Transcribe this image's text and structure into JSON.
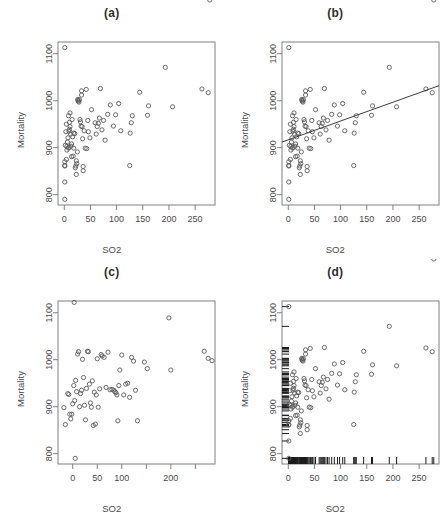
{
  "figure": {
    "axis_labels": {
      "x": "SO2",
      "y": "Mortality"
    }
  },
  "panels": [
    {
      "id": "a",
      "title": "(a)",
      "xlabel": "SO2",
      "ylabel": "Mortality",
      "has_fit_line": false,
      "has_rug": false
    },
    {
      "id": "b",
      "title": "(b)",
      "xlabel": "SO2",
      "ylabel": "Mortality",
      "has_fit_line": true,
      "has_rug": false
    },
    {
      "id": "c",
      "title": "(c)",
      "xlabel": "SO2",
      "ylabel": "Mortality",
      "has_fit_line": false,
      "has_rug": false
    },
    {
      "id": "d",
      "title": "(d)",
      "xlabel": "SO2",
      "ylabel": "Mortality",
      "has_fit_line": false,
      "has_rug": true
    }
  ],
  "chart_data": [
    {
      "type": "scatter",
      "panel": "a",
      "title": "(a)",
      "xlabel": "SO2",
      "ylabel": "Mortality",
      "xlim": [
        -12,
        288
      ],
      "ylim": [
        778,
        1125
      ],
      "xticks": [
        0,
        50,
        100,
        150,
        200,
        250
      ],
      "yticks": [
        800,
        900,
        1000,
        1100
      ],
      "xticklabels": [
        "0",
        "50",
        "100",
        "150",
        "200",
        "250"
      ],
      "yticklabels": [
        "800",
        "900",
        "1000",
        "1100"
      ],
      "grid": false,
      "legend": null,
      "x": [
        1,
        1,
        1,
        1,
        1,
        1,
        2,
        3,
        4,
        4,
        5,
        5,
        6,
        7,
        8,
        8,
        9,
        9,
        10,
        10,
        11,
        11,
        12,
        13,
        14,
        14,
        15,
        16,
        17,
        18,
        18,
        20,
        21,
        22,
        23,
        23,
        24,
        25,
        26,
        26,
        27,
        28,
        29,
        30,
        31,
        32,
        33,
        33,
        34,
        35,
        36,
        36,
        38,
        40,
        42,
        43,
        45,
        46,
        49,
        52,
        59,
        61,
        63,
        65,
        67,
        69,
        72,
        75,
        78,
        83,
        88,
        94,
        98,
        104,
        108,
        125,
        126,
        128,
        130,
        144,
        159,
        161,
        193,
        207,
        263,
        275,
        278
      ],
      "y": [
        1113,
        790,
        827,
        861,
        862,
        870,
        905,
        934,
        950,
        875,
        903,
        895,
        912,
        921,
        968,
        899,
        935,
        901,
        954,
        939,
        974,
        945,
        929,
        903,
        908,
        881,
        960,
        923,
        882,
        931,
        899,
        930,
        857,
        861,
        843,
        872,
        866,
        891,
        1001,
        1003,
        999,
        997,
        1002,
        960,
        955,
        946,
        1021,
        1012,
        945,
        919,
        851,
        860,
        936,
        899,
        1024,
        898,
        958,
        934,
        921,
        981,
        953,
        929,
        945,
        952,
        963,
        1026,
        938,
        958,
        916,
        971,
        991,
        946,
        970,
        994,
        936,
        862,
        931,
        953,
        968,
        1018,
        969,
        989,
        1071,
        987,
        1025,
        1017
      ],
      "annotation": "Scatterplot of Mortality versus SO2 (no fitted line)."
    },
    {
      "type": "scatter",
      "panel": "b",
      "title": "(b)",
      "xlabel": "SO2",
      "ylabel": "Mortality",
      "xlim": [
        -12,
        288
      ],
      "ylim": [
        778,
        1125
      ],
      "xticks": [
        0,
        50,
        100,
        150,
        200,
        250
      ],
      "yticks": [
        800,
        900,
        1000,
        1100
      ],
      "xticklabels": [
        "0",
        "50",
        "100",
        "150",
        "200",
        "250"
      ],
      "yticklabels": [
        "800",
        "900",
        "1000",
        "1100"
      ],
      "grid": false,
      "legend": null,
      "x": [
        1,
        1,
        1,
        1,
        1,
        1,
        2,
        3,
        4,
        4,
        5,
        5,
        6,
        7,
        8,
        8,
        9,
        9,
        10,
        10,
        11,
        11,
        12,
        13,
        14,
        14,
        15,
        16,
        17,
        18,
        18,
        20,
        21,
        22,
        23,
        23,
        24,
        25,
        26,
        26,
        27,
        28,
        29,
        30,
        31,
        32,
        33,
        33,
        34,
        35,
        36,
        36,
        38,
        40,
        42,
        43,
        45,
        46,
        49,
        52,
        59,
        61,
        63,
        65,
        67,
        69,
        72,
        75,
        78,
        83,
        88,
        94,
        98,
        104,
        108,
        125,
        126,
        128,
        130,
        144,
        159,
        161,
        193,
        207,
        263,
        275,
        278
      ],
      "y": [
        1113,
        790,
        827,
        861,
        862,
        870,
        905,
        934,
        950,
        875,
        903,
        895,
        912,
        921,
        968,
        899,
        935,
        901,
        954,
        939,
        974,
        945,
        929,
        903,
        908,
        881,
        960,
        923,
        882,
        931,
        899,
        930,
        857,
        861,
        843,
        872,
        866,
        891,
        1001,
        1003,
        999,
        997,
        1002,
        960,
        955,
        946,
        1021,
        1012,
        945,
        919,
        851,
        860,
        936,
        899,
        1024,
        898,
        958,
        934,
        921,
        981,
        953,
        929,
        945,
        952,
        963,
        1026,
        938,
        958,
        916,
        971,
        991,
        946,
        970,
        994,
        936,
        862,
        931,
        953,
        968,
        1018,
        969,
        989,
        1071,
        987,
        1025,
        1017
      ],
      "fit_line": {
        "x": [
          -12,
          288
        ],
        "y": [
          912,
          1032
        ],
        "intercept": 917,
        "slope": 0.4
      },
      "annotation": "Same scatterplot with a least-squares regression line overlaid."
    },
    {
      "type": "scatter",
      "panel": "c",
      "title": "(c)",
      "xlabel": "SO2",
      "ylabel": "Mortality",
      "xlim": [
        -30,
        290
      ],
      "ylim": [
        778,
        1125
      ],
      "xticks": [
        0,
        50,
        100,
        150,
        200,
        250
      ],
      "yticks": [
        800,
        900,
        1000,
        1100
      ],
      "xticklabels": [
        "0",
        "50",
        "100",
        "",
        "200",
        ""
      ],
      "yticklabels": [
        "800",
        "900",
        "1000",
        "1100"
      ],
      "grid": false,
      "legend": null,
      "x": [
        3,
        5,
        -18,
        -15,
        -10,
        -8,
        -6,
        -4,
        -2,
        0,
        2,
        4,
        6,
        8,
        10,
        12,
        14,
        16,
        18,
        20,
        22,
        24,
        26,
        28,
        30,
        32,
        34,
        36,
        38,
        40,
        42,
        44,
        46,
        48,
        50,
        52,
        55,
        58,
        60,
        64,
        68,
        72,
        76,
        80,
        84,
        86,
        88,
        90,
        92,
        94,
        96,
        100,
        104,
        108,
        112,
        116,
        120,
        124,
        128,
        132,
        146,
        152,
        196,
        200,
        268,
        276,
        284
      ],
      "y": [
        1122,
        790,
        898,
        862,
        928,
        926,
        884,
        874,
        884,
        906,
        945,
        913,
        956,
        932,
        1012,
        1017,
        900,
        928,
        935,
        1001,
        962,
        903,
        872,
        939,
        1018,
        1017,
        948,
        908,
        899,
        955,
        860,
        931,
        863,
        925,
        1002,
        899,
        938,
        1011,
        1008,
        1005,
        941,
        1016,
        936,
        937,
        935,
        932,
        930,
        925,
        870,
        945,
        978,
        1010,
        925,
        948,
        950,
        920,
        1005,
        997,
        935,
        870,
        995,
        981,
        1089,
        978,
        1018,
        1003,
        998
      ],
      "annotation": "Scatterplot of Mortality versus SO2 on an alternate horizontal scale."
    },
    {
      "type": "scatter",
      "panel": "d",
      "title": "(d)",
      "xlabel": "SO2",
      "ylabel": "Mortality",
      "xlim": [
        -12,
        288
      ],
      "ylim": [
        778,
        1125
      ],
      "xticks": [
        0,
        50,
        100,
        150,
        200,
        250
      ],
      "yticks": [
        800,
        900,
        1000,
        1100
      ],
      "xticklabels": [
        "0",
        "50",
        "100",
        "150",
        "200",
        "250"
      ],
      "yticklabels": [
        "800",
        "900",
        "1000",
        "1100"
      ],
      "grid": false,
      "legend": null,
      "x": [
        1,
        1,
        1,
        1,
        1,
        1,
        2,
        3,
        4,
        4,
        5,
        5,
        6,
        7,
        8,
        8,
        9,
        9,
        10,
        10,
        11,
        11,
        12,
        13,
        14,
        14,
        15,
        16,
        17,
        18,
        18,
        20,
        21,
        22,
        23,
        23,
        24,
        25,
        26,
        26,
        27,
        28,
        29,
        30,
        31,
        32,
        33,
        33,
        34,
        35,
        36,
        36,
        38,
        40,
        42,
        43,
        45,
        46,
        49,
        52,
        59,
        61,
        63,
        65,
        67,
        69,
        72,
        75,
        78,
        83,
        88,
        94,
        98,
        104,
        108,
        125,
        126,
        128,
        130,
        144,
        159,
        161,
        193,
        207,
        263,
        275,
        278
      ],
      "y": [
        1113,
        790,
        827,
        861,
        862,
        870,
        905,
        934,
        950,
        875,
        903,
        895,
        912,
        921,
        968,
        899,
        935,
        901,
        954,
        939,
        974,
        945,
        929,
        903,
        908,
        881,
        960,
        923,
        882,
        931,
        899,
        930,
        857,
        861,
        843,
        872,
        866,
        891,
        1001,
        1003,
        999,
        997,
        1002,
        960,
        955,
        946,
        1021,
        1012,
        945,
        919,
        851,
        860,
        936,
        899,
        1024,
        898,
        958,
        934,
        921,
        981,
        953,
        929,
        945,
        952,
        963,
        1026,
        938,
        958,
        916,
        971,
        991,
        946,
        970,
        994,
        936,
        862,
        931,
        953,
        968,
        1018,
        969,
        989,
        1071,
        987,
        1025,
        1017
      ],
      "rug": {
        "bottom": [
          1,
          1,
          1,
          1,
          1,
          1,
          2,
          3,
          4,
          4,
          5,
          5,
          6,
          7,
          8,
          8,
          9,
          9,
          10,
          10,
          11,
          11,
          12,
          13,
          14,
          14,
          15,
          16,
          17,
          18,
          18,
          20,
          21,
          22,
          23,
          23,
          24,
          25,
          26,
          26,
          27,
          28,
          29,
          30,
          31,
          32,
          33,
          33,
          34,
          35,
          36,
          36,
          38,
          40,
          42,
          43,
          45,
          46,
          49,
          52,
          59,
          61,
          63,
          65,
          67,
          69,
          72,
          75,
          78,
          83,
          88,
          94,
          98,
          104,
          108,
          125,
          126,
          128,
          130,
          144,
          159,
          161,
          193,
          207,
          263,
          275,
          278
        ],
        "left": [
          1113,
          790,
          827,
          861,
          862,
          870,
          905,
          934,
          950,
          875,
          903,
          895,
          912,
          921,
          968,
          899,
          935,
          901,
          954,
          939,
          974,
          945,
          929,
          903,
          908,
          881,
          960,
          923,
          882,
          931,
          899,
          930,
          857,
          861,
          843,
          872,
          866,
          891,
          1001,
          1003,
          999,
          997,
          1002,
          960,
          955,
          946,
          1021,
          1012,
          945,
          919,
          851,
          860,
          936,
          899,
          1024,
          898,
          958,
          934,
          921,
          981,
          953,
          929,
          945,
          952,
          963,
          1026,
          938,
          958,
          916,
          971,
          991,
          946,
          970,
          994,
          936,
          862,
          931,
          953,
          968,
          1018,
          969,
          989,
          1071,
          987,
          1025,
          1017
        ]
      },
      "annotation": "Scatterplot with marginal rug plots on the bottom and left axes."
    }
  ]
}
